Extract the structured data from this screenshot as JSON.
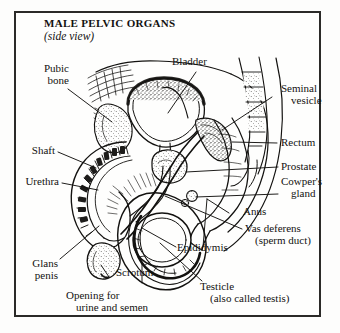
{
  "figure": {
    "title": "MALE PELVIC ORGANS",
    "subtitle": "(side view)",
    "medium": "line-drawing",
    "ink_color": "#131210",
    "paper_color": "#fefefd",
    "frame_color": "#2b2a28"
  },
  "labels": {
    "bladder": {
      "line1": "Bladder"
    },
    "pubic_bone": {
      "line1": "Pubic",
      "line2": "bone"
    },
    "shaft": {
      "line1": "Shaft"
    },
    "urethra": {
      "line1": "Urethra"
    },
    "glans_penis": {
      "line1": "Glans",
      "line2": "penis"
    },
    "opening": {
      "line1": "Opening for",
      "line2": "urine and semen"
    },
    "scrotum": {
      "line1": "Scrotum"
    },
    "testicle": {
      "line1": "Testicle",
      "line2": "(also called testis)"
    },
    "epididymis": {
      "line1": "Epididymis"
    },
    "vas_deferens": {
      "line1": "Vas deferens",
      "line2": "(sperm duct)"
    },
    "anus": {
      "line1": "Anus"
    },
    "cowpers_gland": {
      "line1": "Cowper's",
      "line2": "gland"
    },
    "prostate": {
      "line1": "Prostate"
    },
    "rectum": {
      "line1": "Rectum"
    },
    "seminal_vesicle": {
      "line1": "Seminal",
      "line2": "vesicle"
    }
  }
}
